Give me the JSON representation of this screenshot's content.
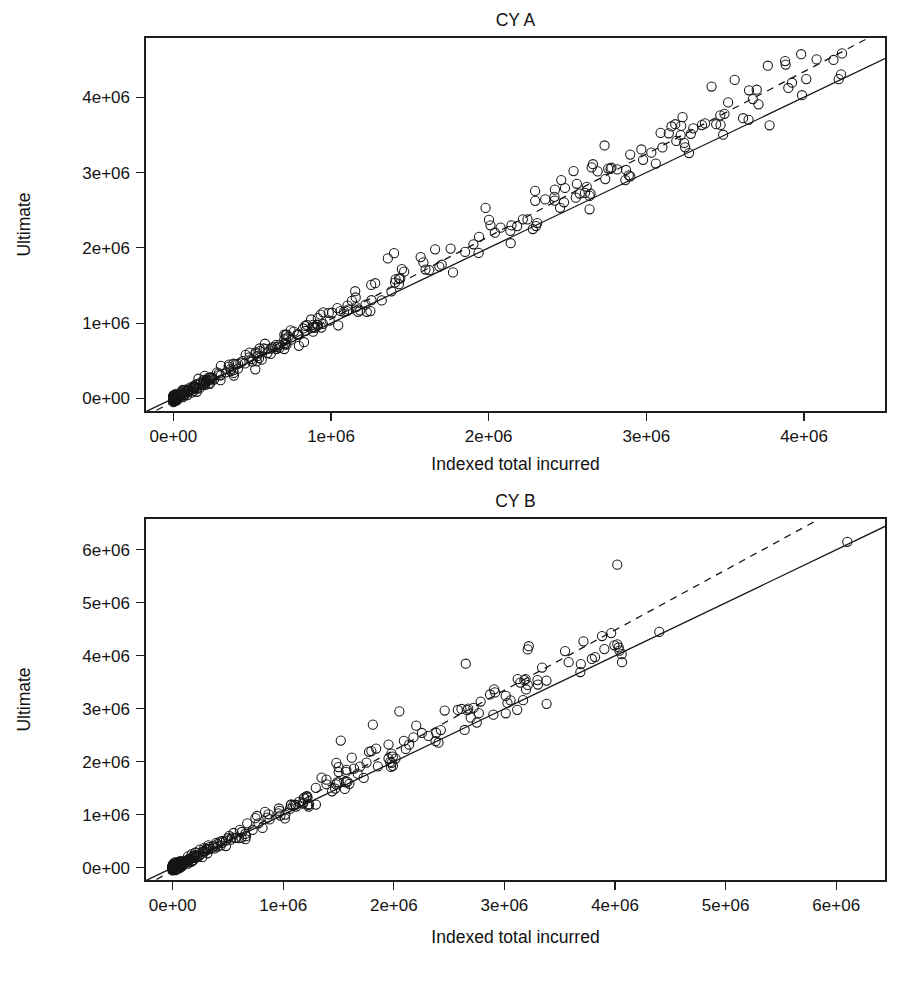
{
  "figure": {
    "background_color": "#ffffff",
    "foreground_color": "#161616",
    "panel_count": 2
  },
  "chart_data": [
    {
      "type": "scatter",
      "title": "CY A",
      "xlabel": "Indexed total incurred",
      "ylabel": "Ultimate",
      "xlim": [
        -180000,
        4520000
      ],
      "ylim": [
        -180000,
        4800000
      ],
      "xticks": [
        0,
        1000000,
        2000000,
        3000000,
        4000000
      ],
      "xticklabels": [
        "0e+00",
        "1e+06",
        "2e+06",
        "3e+06",
        "4e+06"
      ],
      "yticks": [
        0,
        1000000,
        2000000,
        3000000,
        4000000
      ],
      "yticklabels": [
        "0e+00",
        "1e+06",
        "2e+06",
        "3e+06",
        "4e+06"
      ],
      "grid": false,
      "legend": null,
      "marker": "open-circle",
      "marker_size": 4.6,
      "lines": [
        {
          "name": "identity-line",
          "style": "solid",
          "slope": 1.0,
          "intercept": 0,
          "x_from": -180000,
          "x_to": 4520000
        },
        {
          "name": "regression-line",
          "style": "dashed",
          "slope": 1.095,
          "intercept": -40000,
          "x_from": -180000,
          "x_to": 4400000
        }
      ],
      "point_generator": {
        "n": 330,
        "seed": 20240517,
        "x_max": 4250000,
        "x_shape": 3.1,
        "slope": 1.072,
        "noise_base": 26000,
        "noise_prop": 0.052
      },
      "points_notable": [
        [
          3880000,
          4480000
        ],
        [
          4220000,
          4240000
        ],
        [
          3560000,
          4230000
        ],
        [
          3700000,
          4100000
        ],
        [
          3060000,
          3120000
        ],
        [
          3190000,
          3420000
        ],
        [
          2460000,
          2900000
        ],
        [
          2640000,
          2690000
        ],
        [
          1980000,
          2530000
        ],
        [
          2300000,
          2290000
        ],
        [
          2280000,
          2250000
        ],
        [
          1660000,
          1980000
        ],
        [
          1400000,
          1930000
        ],
        [
          1360000,
          1860000
        ],
        [
          1280000,
          1530000
        ],
        [
          1040000,
          1200000
        ]
      ]
    },
    {
      "type": "scatter",
      "title": "CY B",
      "xlabel": "Indexed total incurred",
      "ylabel": "Ultimate",
      "xlim": [
        -250000,
        6450000
      ],
      "ylim": [
        -250000,
        6600000
      ],
      "xticks": [
        0,
        1000000,
        2000000,
        3000000,
        4000000,
        5000000,
        6000000
      ],
      "xticklabels": [
        "0e+00",
        "1e+06",
        "2e+06",
        "3e+06",
        "4e+06",
        "5e+06",
        "6e+06"
      ],
      "yticks": [
        0,
        1000000,
        2000000,
        3000000,
        4000000,
        5000000,
        6000000
      ],
      "yticklabels": [
        "0e+00",
        "1e+06",
        "2e+06",
        "3e+06",
        "4e+06",
        "5e+06",
        "6e+06"
      ],
      "grid": false,
      "legend": null,
      "marker": "open-circle",
      "marker_size": 4.6,
      "lines": [
        {
          "name": "identity-line",
          "style": "solid",
          "slope": 1.0,
          "intercept": 0,
          "x_from": -250000,
          "x_to": 6450000
        },
        {
          "name": "regression-line",
          "style": "dashed",
          "slope": 1.135,
          "intercept": -55000,
          "x_from": -250000,
          "x_to": 5830000
        }
      ],
      "point_generator": {
        "n": 300,
        "seed": 771003,
        "x_max": 4100000,
        "x_shape": 3.4,
        "slope": 1.068,
        "noise_base": 30000,
        "noise_prop": 0.058
      },
      "points_notable": [
        [
          6100000,
          6150000
        ],
        [
          4020000,
          5720000
        ],
        [
          4400000,
          4450000
        ],
        [
          3220000,
          4180000
        ],
        [
          3210000,
          4120000
        ],
        [
          3790000,
          3940000
        ],
        [
          4060000,
          4030000
        ],
        [
          2650000,
          3850000
        ],
        [
          3120000,
          3560000
        ],
        [
          3180000,
          3540000
        ],
        [
          2870000,
          3270000
        ],
        [
          2750000,
          2740000
        ],
        [
          2640000,
          2600000
        ],
        [
          2050000,
          2950000
        ],
        [
          1810000,
          2700000
        ],
        [
          1520000,
          2400000
        ],
        [
          1840000,
          2250000
        ],
        [
          1480000,
          1980000
        ],
        [
          1500000,
          1900000
        ]
      ]
    }
  ]
}
